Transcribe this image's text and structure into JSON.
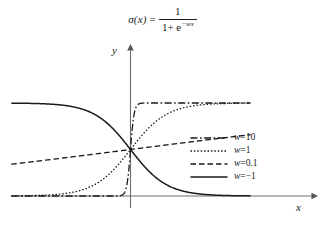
{
  "figure": {
    "title_formula": {
      "function_name": "σ(x)",
      "equals": "=",
      "numerator": "1",
      "denominator_prefix": "1+ e",
      "denominator_exponent": "−wx",
      "plain": "σ(x) = 1 / (1 + e^(−wx))"
    },
    "axes": {
      "y_label": "y",
      "x_label": "x",
      "x_axis_arrow": "arrow-right",
      "y_axis_arrow": "arrow-up"
    },
    "legend": {
      "entries": [
        {
          "label": "w=10",
          "style": "dashdot",
          "w": 10
        },
        {
          "label": "w=1",
          "style": "dotted",
          "w": 1
        },
        {
          "label": "w=0.1",
          "style": "dashed",
          "w": 0.1
        },
        {
          "label": "w=−1",
          "style": "solid",
          "w": -1
        }
      ]
    }
  },
  "chart_data": {
    "type": "line",
    "xlabel": "x",
    "ylabel": "y",
    "grid": false,
    "legend_position": "center-right",
    "xlim": [
      -10,
      10
    ],
    "ylim": [
      0,
      1
    ],
    "x_axis_value": 0,
    "y_axis_value": 0,
    "series": [
      {
        "name": "w=10",
        "w": 10,
        "style": "dashdot",
        "color": "#1a1a1a",
        "x": [
          -10,
          -8,
          -6,
          -4,
          -3,
          -2,
          -1.5,
          -1,
          -0.75,
          -0.5,
          -0.25,
          0,
          0.25,
          0.5,
          0.75,
          1,
          1.5,
          2,
          3,
          4,
          6,
          8,
          10
        ],
        "y": [
          0.0,
          0.0,
          0.0,
          0.0,
          0.0,
          0.0,
          0.0,
          0.0,
          0.001,
          0.0067,
          0.076,
          0.5,
          0.924,
          0.993,
          0.999,
          1.0,
          1.0,
          1.0,
          1.0,
          1.0,
          1.0,
          1.0,
          1.0
        ]
      },
      {
        "name": "w=1",
        "w": 1,
        "style": "dotted",
        "color": "#1a1a1a",
        "x": [
          -10,
          -8,
          -6,
          -5,
          -4,
          -3,
          -2,
          -1,
          0,
          1,
          2,
          3,
          4,
          5,
          6,
          8,
          10
        ],
        "y": [
          0.0,
          0.0003,
          0.0025,
          0.0067,
          0.018,
          0.047,
          0.119,
          0.269,
          0.5,
          0.731,
          0.881,
          0.953,
          0.982,
          0.993,
          0.998,
          1.0,
          1.0
        ]
      },
      {
        "name": "w=0.1",
        "w": 0.1,
        "style": "dashed",
        "color": "#1a1a1a",
        "x": [
          -10,
          -8,
          -6,
          -4,
          -2,
          0,
          2,
          4,
          6,
          8,
          10
        ],
        "y": [
          0.269,
          0.31,
          0.354,
          0.401,
          0.45,
          0.5,
          0.55,
          0.599,
          0.646,
          0.69,
          0.731
        ]
      },
      {
        "name": "w=−1",
        "w": -1,
        "style": "solid",
        "color": "#1a1a1a",
        "x": [
          -10,
          -8,
          -6,
          -5,
          -4,
          -3,
          -2,
          -1,
          0,
          1,
          2,
          3,
          4,
          5,
          6,
          8,
          10
        ],
        "y": [
          1.0,
          1.0,
          0.998,
          0.993,
          0.982,
          0.953,
          0.881,
          0.731,
          0.5,
          0.269,
          0.119,
          0.047,
          0.018,
          0.0067,
          0.0025,
          0.0003,
          0.0
        ]
      }
    ]
  }
}
